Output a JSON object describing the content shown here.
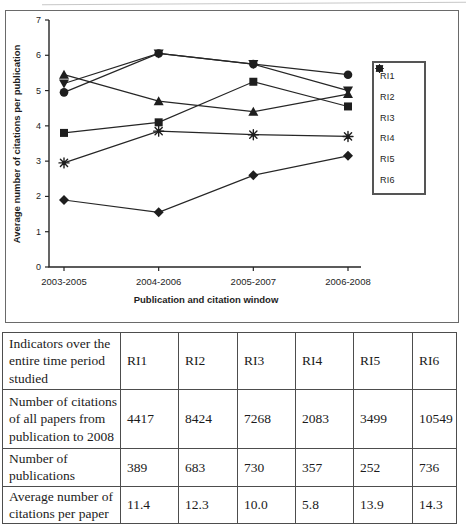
{
  "colors": {
    "ink": "#1e1e1e",
    "line": "#262626",
    "table_border": "#4d4d4d",
    "background": "#ffffff"
  },
  "chart_data": {
    "type": "line",
    "title": "",
    "xlabel": "Publication and citation window",
    "ylabel": "Average number of citations per publication",
    "categories": [
      "2003-2005",
      "2004-2006",
      "2005-2007",
      "2006-2008"
    ],
    "ylim": [
      0,
      7
    ],
    "y_ticks": [
      0,
      1,
      2,
      3,
      4,
      5,
      6,
      7
    ],
    "grid": false,
    "legend_position": "right",
    "series": [
      {
        "name": "RI1",
        "marker": "square-icon",
        "values": [
          3.8,
          4.1,
          5.25,
          4.55
        ]
      },
      {
        "name": "RI2",
        "marker": "circle-icon",
        "values": [
          4.95,
          6.05,
          5.75,
          5.45
        ]
      },
      {
        "name": "RI3",
        "marker": "asterisk-icon",
        "values": [
          2.95,
          3.85,
          3.75,
          3.7
        ]
      },
      {
        "name": "RI4",
        "marker": "diamond-icon",
        "values": [
          1.9,
          1.55,
          2.6,
          3.15
        ]
      },
      {
        "name": "RI5",
        "marker": "triangle-up-icon",
        "values": [
          5.45,
          4.7,
          4.4,
          4.9
        ]
      },
      {
        "name": "RI6",
        "marker": "triangle-down-icon",
        "values": [
          5.2,
          6.05,
          5.75,
          5.0
        ]
      }
    ]
  },
  "table": {
    "corner_label": "Indicators over the entire time period studied",
    "columns": [
      "RI1",
      "RI2",
      "RI3",
      "RI4",
      "RI5",
      "RI6"
    ],
    "rows": [
      {
        "label": "Number of citations of all papers from publication to 2008",
        "values": [
          "4417",
          "8424",
          "7268",
          "2083",
          "3499",
          "10549"
        ]
      },
      {
        "label": "Number of publications",
        "values": [
          "389",
          "683",
          "730",
          "357",
          "252",
          "736"
        ]
      },
      {
        "label": "Average number of citations per paper",
        "values": [
          "11.4",
          "12.3",
          "10.0",
          "5.8",
          "13.9",
          "14.3"
        ]
      }
    ]
  }
}
